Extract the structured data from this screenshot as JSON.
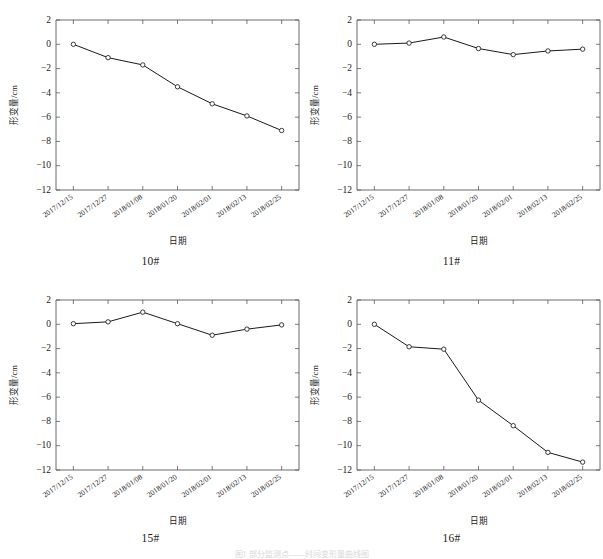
{
  "figure": {
    "caption": "图1 部分监测点——时间变形量曲线图",
    "panel_count": 4
  },
  "axis": {
    "xlabel": "日期",
    "ylabel": "形变量/cm",
    "ylim": [
      -12,
      2
    ],
    "yticks": [
      "2",
      "0",
      "−2",
      "−4",
      "−6",
      "−8",
      "−10",
      "−12"
    ],
    "ytick_values": [
      2,
      0,
      -2,
      -4,
      -6,
      -8,
      -10,
      -12
    ],
    "categories": [
      "2017/12/15",
      "2017/12/27",
      "2018/01/08",
      "2018/01/20",
      "2018/02/01",
      "2018/02/13",
      "2018/02/25"
    ]
  },
  "chart_data": [
    {
      "type": "line",
      "title": "10#",
      "xlabel": "日期",
      "ylabel": "形变量/cm",
      "ylim": [
        -12,
        2
      ],
      "grid": false,
      "legend": "none",
      "marker": "circle",
      "categories": [
        "2017/12/15",
        "2017/12/27",
        "2018/01/08",
        "2018/01/20",
        "2018/02/01",
        "2018/02/13",
        "2018/02/25"
      ],
      "values": [
        0.0,
        -1.1,
        -1.7,
        -3.5,
        -4.9,
        -5.9,
        -7.1
      ]
    },
    {
      "type": "line",
      "title": "11#",
      "xlabel": "日期",
      "ylabel": "形变量/cm",
      "ylim": [
        -12,
        2
      ],
      "grid": false,
      "legend": "none",
      "marker": "circle",
      "categories": [
        "2017/12/15",
        "2017/12/27",
        "2018/01/08",
        "2018/01/20",
        "2018/02/01",
        "2018/02/13",
        "2018/02/25"
      ],
      "values": [
        0.0,
        0.1,
        0.6,
        -0.35,
        -0.85,
        -0.55,
        -0.4
      ]
    },
    {
      "type": "line",
      "title": "15#",
      "xlabel": "日期",
      "ylabel": "形变量/cm",
      "ylim": [
        -12,
        2
      ],
      "grid": false,
      "legend": "none",
      "marker": "circle",
      "categories": [
        "2017/12/15",
        "2017/12/27",
        "2018/01/08",
        "2018/01/20",
        "2018/02/01",
        "2018/02/13",
        "2018/02/25"
      ],
      "values": [
        0.05,
        0.2,
        1.0,
        0.05,
        -0.9,
        -0.4,
        -0.05
      ]
    },
    {
      "type": "line",
      "title": "16#",
      "xlabel": "日期",
      "ylabel": "形变量/cm",
      "ylim": [
        -12,
        2
      ],
      "grid": false,
      "legend": "none",
      "marker": "circle",
      "categories": [
        "2017/12/15",
        "2017/12/27",
        "2018/01/08",
        "2018/01/20",
        "2018/02/01",
        "2018/02/13",
        "2018/02/25"
      ],
      "values": [
        0.0,
        -1.85,
        -2.05,
        -6.25,
        -8.35,
        -10.55,
        -11.35
      ]
    }
  ],
  "colors": {
    "line": "#1a1a1a",
    "axis": "#5a5a5a",
    "marker_fill": "#ffffff",
    "background": "#ffffff"
  }
}
